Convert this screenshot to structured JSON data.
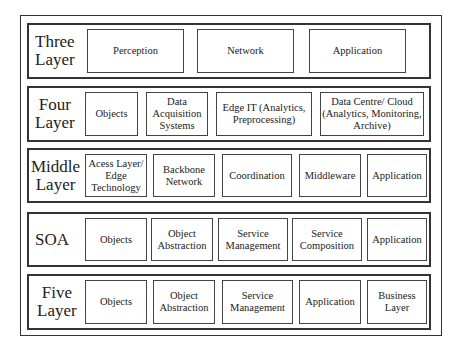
{
  "diagram": {
    "rows": [
      {
        "label_line1": "Three",
        "label_line2": "Layer",
        "cells": [
          "Perception",
          "Network",
          "Application"
        ]
      },
      {
        "label_line1": "Four",
        "label_line2": "Layer",
        "cells": [
          "Objects",
          "Data Acquisition Systems",
          "Edge IT (Analytics, Preprocessing)",
          "Data Centre/ Cloud (Analytics, Monitoring, Archive)"
        ]
      },
      {
        "label_line1": "Middle",
        "label_line2": "Layer",
        "cells": [
          "Acess Layer/ Edge Technology",
          "Backbone Network",
          "Coordination",
          "Middleware",
          "Application"
        ]
      },
      {
        "label_line1": "SOA",
        "label_line2": "",
        "cells": [
          "Objects",
          "Object Abstraction",
          "Service Management",
          "Service Composition",
          "Application"
        ]
      },
      {
        "label_line1": "Five",
        "label_line2": "Layer",
        "cells": [
          "Objects",
          "Object Abstraction",
          "Service Management",
          "Application",
          "Business Layer"
        ]
      }
    ]
  }
}
